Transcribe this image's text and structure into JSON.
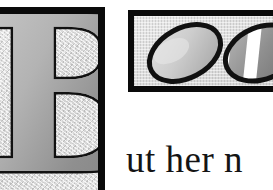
{
  "page": {
    "kind": "scanned-book-page-fragment",
    "background_color": "#ffffff",
    "width": 273,
    "height": 190
  },
  "dropcap_panel": {
    "name": "illuminated-initial-panel",
    "letter": "B",
    "letter_fill_color": "#9e9e9e",
    "letter_outline_color": "#111111",
    "background_color": "#dcdcdc",
    "frame_color": "#0a0a0a",
    "frame_thickness_px": 7,
    "cropped_edges": "left, bottom"
  },
  "egg_panel": {
    "name": "egg-illustration-panel",
    "frame_color": "#0a0a0a",
    "frame_thickness_px": 6,
    "background_color": "#dcdcdc",
    "cropped_edges": "right",
    "eggs": [
      {
        "name": "plain-egg",
        "label": "plain shaded egg",
        "fill_color": "#c9c9c9",
        "outline_color": "#111111",
        "pattern": "none",
        "rotation_deg": -28
      },
      {
        "name": "striped-egg",
        "label": "egg with diagonal stripes",
        "fill_color": "#9a9a9a",
        "outline_color": "#111111",
        "pattern": "diagonal-stripes",
        "stripe_color": "#ffffff",
        "stripe_count": 3,
        "rotation_deg": -22
      }
    ]
  },
  "body_text": {
    "name": "text-line",
    "text": "ut her n",
    "color": "#141414",
    "note": "continuation of drop cap B, clipped at right edge"
  }
}
